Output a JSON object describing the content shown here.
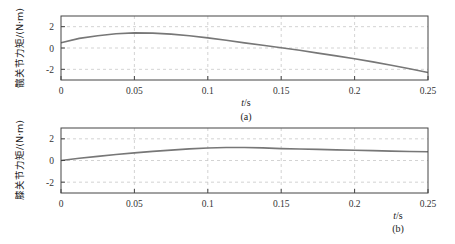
{
  "chart_data": [
    {
      "type": "line",
      "panel": "(a)",
      "caption": "(a)",
      "title": "",
      "xlabel": "t/s",
      "ylabel": "髋关节力矩/(N·m)",
      "xlim": [
        0,
        0.25
      ],
      "ylim": [
        -3,
        3
      ],
      "xticks": [
        0,
        0.05,
        0.1,
        0.15,
        0.2,
        0.25
      ],
      "xtick_labels": [
        "0",
        "0.05",
        "0.1",
        "0.15",
        "0.2",
        "0.25"
      ],
      "yticks": [
        -2,
        0,
        2
      ],
      "ytick_labels": [
        "-2",
        "0",
        "2"
      ],
      "grid": true,
      "series": [
        {
          "name": "hip torque",
          "color": "#777777",
          "x": [
            0,
            0.0125,
            0.025,
            0.0375,
            0.05,
            0.0625,
            0.075,
            0.0875,
            0.1,
            0.1125,
            0.125,
            0.1375,
            0.15,
            0.1625,
            0.175,
            0.1875,
            0.2,
            0.2125,
            0.225,
            0.2375,
            0.25
          ],
          "y": [
            0.5,
            0.9,
            1.15,
            1.33,
            1.42,
            1.4,
            1.3,
            1.15,
            0.95,
            0.72,
            0.48,
            0.25,
            0.02,
            -0.22,
            -0.48,
            -0.74,
            -1.0,
            -1.3,
            -1.62,
            -1.95,
            -2.3
          ]
        }
      ]
    },
    {
      "type": "line",
      "panel": "(b)",
      "caption": "(b)",
      "title": "",
      "xlabel": "t/s",
      "ylabel": "膝关节力矩/(N·m)",
      "xlim": [
        0,
        0.25
      ],
      "ylim": [
        -3,
        3
      ],
      "xticks": [
        0,
        0.05,
        0.1,
        0.15,
        0.2,
        0.25
      ],
      "xtick_labels": [
        "0",
        "0.05",
        "0.1",
        "0.15",
        "0.2",
        "0.25"
      ],
      "yticks": [
        -2,
        0,
        2
      ],
      "ytick_labels": [
        "-2",
        "0",
        "2"
      ],
      "grid": true,
      "series": [
        {
          "name": "knee torque",
          "color": "#777777",
          "x": [
            0,
            0.0125,
            0.025,
            0.0375,
            0.05,
            0.0625,
            0.075,
            0.0875,
            0.1,
            0.1125,
            0.125,
            0.1375,
            0.15,
            0.1625,
            0.175,
            0.1875,
            0.2,
            0.2125,
            0.225,
            0.2375,
            0.25
          ],
          "y": [
            0.0,
            0.2,
            0.38,
            0.55,
            0.7,
            0.84,
            0.96,
            1.07,
            1.15,
            1.2,
            1.2,
            1.16,
            1.1,
            1.06,
            1.02,
            0.98,
            0.95,
            0.91,
            0.87,
            0.83,
            0.8
          ]
        }
      ]
    }
  ],
  "colors": {
    "axis": "#444444",
    "grid": "#c8c8c8",
    "line": "#777777"
  }
}
